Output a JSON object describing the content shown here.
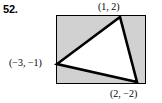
{
  "problem": {
    "number": "52."
  },
  "figure": {
    "type": "geometry-diagram",
    "shaded_region": {
      "shape": "rectangle",
      "fill_color": "#d1d1d1",
      "stroke_color": "#000000"
    },
    "triangle": {
      "fill_color": "#ffffff",
      "stroke_color": "#000000"
    },
    "vertices": [
      {
        "name": "top-vertex",
        "label": "(1, 2)",
        "x": 1,
        "y": 2
      },
      {
        "name": "left-vertex",
        "label": "(−3, −1)",
        "x": -3,
        "y": -1
      },
      {
        "name": "bottom-right-vertex",
        "label": "(2, −2)",
        "x": 2,
        "y": -2
      }
    ]
  }
}
